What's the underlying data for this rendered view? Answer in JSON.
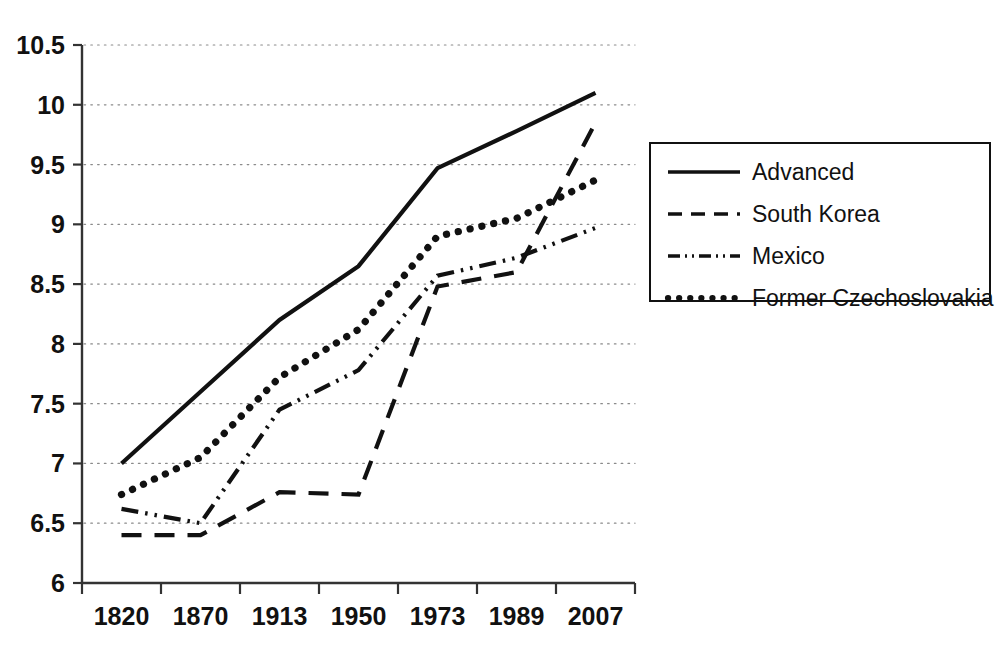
{
  "chart_data": {
    "type": "line",
    "title": "",
    "xlabel": "",
    "ylabel": "",
    "categories": [
      "1820",
      "1870",
      "1913",
      "1950",
      "1973",
      "1989",
      "2007"
    ],
    "ylim": [
      6,
      10.5
    ],
    "ytick_labels": [
      "6",
      "6.5",
      "7",
      "7.5",
      "8",
      "8.5",
      "9",
      "9.5",
      "10",
      "10.5"
    ],
    "ytick_values": [
      6,
      6.5,
      7,
      7.5,
      8,
      8.5,
      9,
      9.5,
      10,
      10.5
    ],
    "grid": "horizontal-dotted",
    "legend_position": "right",
    "series": [
      {
        "name": "Advanced",
        "style": "solid",
        "color": "#111111",
        "values": [
          7.0,
          7.6,
          8.2,
          8.65,
          9.47,
          9.78,
          10.1
        ]
      },
      {
        "name": "South Korea",
        "style": "dashed",
        "color": "#111111",
        "values": [
          6.4,
          6.4,
          6.76,
          6.74,
          8.48,
          8.6,
          9.85
        ]
      },
      {
        "name": "Mexico",
        "style": "dash-dot-dot",
        "color": "#111111",
        "values": [
          6.62,
          6.5,
          7.45,
          7.78,
          8.57,
          8.72,
          8.97
        ]
      },
      {
        "name": "Former Czechoslovakia",
        "style": "dotted",
        "color": "#111111",
        "values": [
          6.74,
          7.05,
          7.72,
          8.12,
          8.9,
          9.05,
          9.37
        ]
      }
    ]
  },
  "legend": {
    "entries": [
      {
        "label": "Advanced"
      },
      {
        "label": "South Korea"
      },
      {
        "label": "Mexico"
      },
      {
        "label": "Former Czechoslovakia"
      }
    ]
  },
  "axes": {
    "y_labels": [
      "10.5",
      "10",
      "9.5",
      "9",
      "8.5",
      "8",
      "7.5",
      "7",
      "6.5",
      "6"
    ],
    "x_labels": [
      "1820",
      "1870",
      "1913",
      "1950",
      "1973",
      "1989",
      "2007"
    ]
  }
}
